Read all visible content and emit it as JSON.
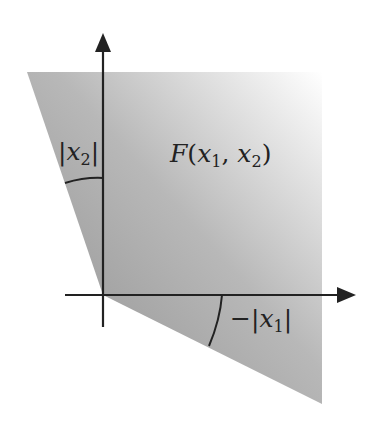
{
  "diagram": {
    "region_label": {
      "name": "F",
      "open": "(",
      "v1": "x",
      "s1": "1",
      "comma": ", ",
      "v2": "x",
      "s2": "2",
      "close": ")"
    },
    "angle_top_label": {
      "bar_l": "|",
      "v": "x",
      "s": "2",
      "bar_r": "|"
    },
    "angle_bottom_label": {
      "minus": "−",
      "bar_l": "|",
      "v": "x",
      "s": "1",
      "bar_r": "|"
    },
    "colors": {
      "fill_dark": "#9a9a9a",
      "fill_light": "#f2f2f2",
      "axis": "#222222"
    }
  }
}
